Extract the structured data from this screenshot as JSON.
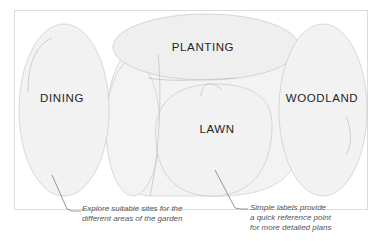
{
  "diagram": {
    "zones": [
      {
        "id": "dining",
        "label": "DINING"
      },
      {
        "id": "planting",
        "label": "PLANTING"
      },
      {
        "id": "lawn",
        "label": "LAWN"
      },
      {
        "id": "woodland",
        "label": "WOODLAND"
      }
    ],
    "annotations": [
      {
        "id": "explore",
        "lines": [
          "Explore suitable sites for the",
          "different areas of the garden"
        ]
      },
      {
        "id": "simple",
        "lines": [
          "Simple labels provide",
          "a quick reference point",
          "for more detailed plans"
        ]
      }
    ],
    "colors": {
      "frame": "#dcdcdc",
      "shape_fill": "#f2f2f2",
      "shape_stroke": "#cfcfcf",
      "label_text": "#1f1f1f",
      "note_text": "#555555",
      "leader_line": "#555555"
    }
  }
}
